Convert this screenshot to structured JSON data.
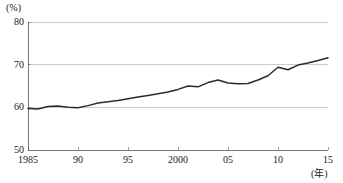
{
  "chart_data": {
    "type": "line",
    "title": "",
    "xlabel": "(年)",
    "ylabel": "(%)",
    "xlim": [
      1985,
      2015
    ],
    "ylim": [
      50,
      80
    ],
    "grid": true,
    "legend": "none",
    "y_ticks": [
      80,
      70,
      60,
      50
    ],
    "y_tick_labels": [
      "80",
      "70",
      "60",
      "50"
    ],
    "x_ticks": [
      1985,
      1990,
      1995,
      2000,
      2005,
      2010,
      2015
    ],
    "x_tick_labels": [
      "1985",
      "90",
      "95",
      "2000",
      "05",
      "10",
      "15"
    ],
    "line_color": "#2b2b2b",
    "grid_color": "#b8b8b8",
    "x": [
      1985,
      1986,
      1987,
      1988,
      1989,
      1990,
      1991,
      1992,
      1993,
      1994,
      1995,
      1996,
      1997,
      1998,
      1999,
      2000,
      2001,
      2002,
      2003,
      2004,
      2005,
      2006,
      2007,
      2008,
      2009,
      2010,
      2011,
      2012,
      2013,
      2014,
      2015
    ],
    "values": [
      59.7,
      59.6,
      60.2,
      60.3,
      60.0,
      59.9,
      60.4,
      61.0,
      61.3,
      61.6,
      62.0,
      62.4,
      62.8,
      63.2,
      63.6,
      64.2,
      65.0,
      64.8,
      65.8,
      66.4,
      65.7,
      65.5,
      65.6,
      66.4,
      67.4,
      69.4,
      68.8,
      69.9,
      70.4,
      71.0,
      71.6
    ]
  },
  "axis": {
    "y_unit": "(%)",
    "x_unit": "(年)"
  }
}
